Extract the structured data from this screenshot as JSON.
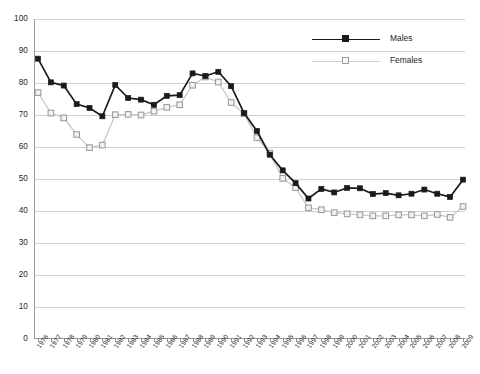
{
  "chart_data": {
    "type": "line",
    "title": "",
    "subtitle": "",
    "xlabel": "",
    "ylabel": "",
    "xlim": [
      1976,
      2009
    ],
    "ylim": [
      0,
      100
    ],
    "ytick_step": 10,
    "grid": true,
    "legend_position": "top-right",
    "categories": [
      "1976",
      "1977",
      "1978",
      "1979",
      "1980",
      "1981",
      "1982",
      "1983",
      "1984",
      "1985",
      "1986",
      "1987",
      "1988",
      "1989",
      "1990",
      "1991",
      "1992",
      "1993",
      "1994",
      "1995",
      "1996",
      "1997",
      "1998",
      "1999",
      "2000",
      "2001",
      "2002",
      "2003",
      "2004",
      "2005",
      "2006",
      "2007",
      "2008",
      "2009"
    ],
    "yticks": [
      "0",
      "10",
      "20",
      "30",
      "40",
      "50",
      "60",
      "70",
      "80",
      "90",
      "100"
    ],
    "series": [
      {
        "name": "Males",
        "color": "#1a1a1a",
        "marker": "filled-square",
        "values": [
          87.6,
          80.2,
          79.2,
          73.4,
          72.2,
          69.6,
          79.4,
          75.3,
          74.8,
          73.2,
          76.0,
          76.2,
          83.0,
          82.2,
          83.5,
          79.0,
          70.6,
          65.0,
          57.6,
          52.7,
          48.7,
          43.9,
          46.9,
          45.8,
          47.2,
          47.1,
          45.3,
          45.6,
          44.9,
          45.4,
          46.7,
          45.4,
          44.4,
          49.8
        ]
      },
      {
        "name": "Females",
        "color": "#c8c8c8",
        "marker": "open-square",
        "values": [
          77.0,
          70.6,
          69.1,
          63.9,
          59.8,
          60.6,
          70.1,
          70.2,
          70.0,
          71.2,
          72.4,
          73.2,
          79.3,
          81.9,
          80.3,
          73.9,
          70.4,
          62.9,
          58.1,
          50.2,
          47.3,
          41.0,
          40.4,
          39.5,
          39.1,
          38.8,
          38.5,
          38.5,
          38.8,
          38.8,
          38.5,
          38.9,
          38.0,
          41.4
        ]
      }
    ],
    "legend": [
      {
        "label": "Males"
      },
      {
        "label": "Females"
      }
    ]
  }
}
